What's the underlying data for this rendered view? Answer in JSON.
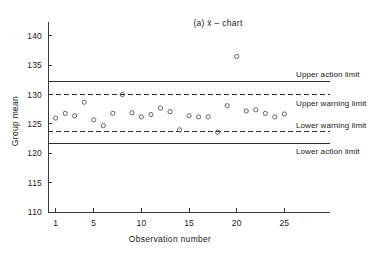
{
  "chart_data": {
    "type": "scatter",
    "title": "(a) x̄ – chart",
    "xlabel": "Observation number",
    "ylabel": "Group mean",
    "xlim": [
      0.2,
      25.8
    ],
    "ylim": [
      110,
      141
    ],
    "grid": false,
    "legend": "none",
    "xticks": [
      1,
      5,
      10,
      15,
      20,
      25
    ],
    "xtick_labels": [
      "1",
      "5",
      "10",
      "15",
      "20",
      "25"
    ],
    "yticks": [
      110,
      115,
      120,
      125,
      130,
      135,
      140
    ],
    "ytick_labels": [
      "110",
      "115",
      "120",
      "125",
      "130",
      "135",
      "140"
    ],
    "x": [
      1,
      2,
      3,
      4,
      5,
      6,
      7,
      8,
      9,
      10,
      11,
      12,
      13,
      14,
      15,
      16,
      17,
      18,
      19,
      20,
      21,
      22,
      23,
      24,
      25
    ],
    "values": [
      126.0,
      126.8,
      126.4,
      128.7,
      125.7,
      124.7,
      126.8,
      130.0,
      126.9,
      126.2,
      126.6,
      127.7,
      127.1,
      124.0,
      126.4,
      126.2,
      126.2,
      123.6,
      128.1,
      136.5,
      127.2,
      127.4,
      126.8,
      126.2,
      126.7
    ],
    "annotations": [
      {
        "name": "upper-action-limit",
        "label": "Upper action limit",
        "value": 132.3,
        "style": "solid"
      },
      {
        "name": "upper-warning-limit",
        "label": "Upper warning limit",
        "value": 130.0,
        "style": "dashed"
      },
      {
        "name": "lower-warning-limit",
        "label": "Lower warning limit",
        "value": 123.7,
        "style": "dashed"
      },
      {
        "name": "lower-action-limit",
        "label": "Lower action limit",
        "value": 121.7,
        "style": "solid"
      }
    ]
  },
  "labels": {
    "title": "(a) x̄ – chart",
    "xlabel": "Observation number",
    "ylabel": "Group mean",
    "upper_action_limit": "Upper action limit",
    "upper_warning_limit": "Upper warning limit",
    "lower_warning_limit": "Lower warning limit",
    "lower_action_limit": "Lower action limit"
  },
  "colors": {
    "background": "#ffffff",
    "axis": "#3a3a3a",
    "text": "#1a1a1a",
    "limit_line": "#2b2b2b",
    "marker": "#555555"
  }
}
